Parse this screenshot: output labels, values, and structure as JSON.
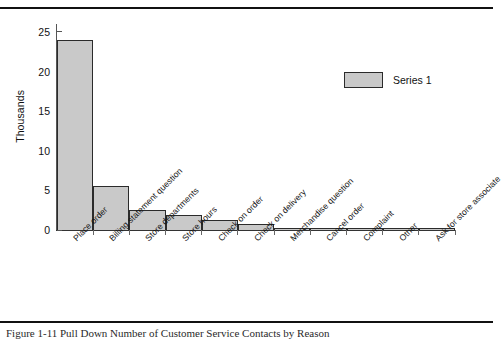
{
  "figure": {
    "caption": "Figure 1-11   Pull Down Number of Customer Service Contacts by Reason",
    "ylabel": "Thousands"
  },
  "legend": {
    "position": "top-right",
    "entries": [
      {
        "label": "Series 1",
        "color": "#c9c9c9"
      }
    ]
  },
  "chart_data": {
    "type": "bar",
    "title": "",
    "xlabel": "",
    "ylabel": "Thousands",
    "ylim": [
      0,
      26
    ],
    "yticks": [
      0,
      5,
      10,
      15,
      20,
      25
    ],
    "grid": false,
    "legend_position": "top-right",
    "categories": [
      "Place order",
      "Billing statement question",
      "Store departments",
      "Store hours",
      "Check on order",
      "Check on delivery",
      "Merchandise question",
      "Cancel order",
      "Complaint",
      "Other",
      "Ask for store associate"
    ],
    "series": [
      {
        "name": "Series 1",
        "color": "#c9c9c9",
        "values": [
          24.0,
          5.6,
          2.5,
          1.9,
          1.3,
          0.8,
          0.3,
          0.25,
          0.2,
          0.2,
          0.2
        ]
      }
    ]
  }
}
